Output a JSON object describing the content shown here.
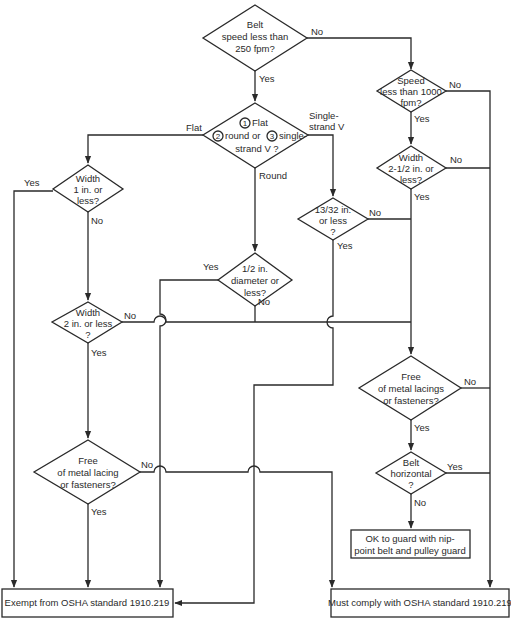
{
  "decisions": {
    "d1": {
      "lines": [
        "Belt",
        "speed less than",
        "250 fpm?"
      ]
    },
    "d2": {
      "lines": [
        "Flat",
        "round or",
        "single-",
        "strand V ?"
      ],
      "markers": [
        "1",
        "2",
        "3"
      ]
    },
    "d3": {
      "lines": [
        "Speed",
        "less than 1000",
        "fpm?"
      ]
    },
    "d4": {
      "lines": [
        "Width",
        "2-1/2 in. or",
        "less?"
      ]
    },
    "d5": {
      "lines": [
        "Width",
        "1 in. or",
        "less?"
      ]
    },
    "d6": {
      "lines": [
        "13/32 in.",
        "or less",
        "?"
      ]
    },
    "d7": {
      "lines": [
        "1/2 in.",
        "diameter or",
        "less?"
      ]
    },
    "d8": {
      "lines": [
        "Width",
        "2 in. or less",
        "?"
      ]
    },
    "d9": {
      "lines": [
        "Free",
        "of metal lacing",
        "or fasteners?"
      ]
    },
    "d10": {
      "lines": [
        "Free",
        "of metal lacings",
        "or fasteners?"
      ]
    },
    "d11": {
      "lines": [
        "Belt",
        "horizontal",
        "?"
      ]
    }
  },
  "branch_labels": {
    "d1_no": "No",
    "d1_yes": "Yes",
    "d2_flat": "Flat",
    "d2_round": "Round",
    "d2_single_1": "Single-",
    "d2_single_2": "strand V",
    "d3_no": "No",
    "d3_yes": "Yes",
    "d4_no": "No",
    "d4_yes": "Yes",
    "d5_yes": "Yes",
    "d5_no": "No",
    "d6_no": "No",
    "d6_yes": "Yes",
    "d7_yes": "Yes",
    "d7_no": "No",
    "d8_no": "No",
    "d8_yes": "Yes",
    "d9_no": "No",
    "d9_yes": "Yes",
    "d10_no": "No",
    "d10_yes": "Yes",
    "d11_yes": "Yes",
    "d11_no": "No"
  },
  "outcomes": {
    "guard": {
      "lines": [
        "OK to guard with nip-",
        "point belt and pulley guard"
      ]
    },
    "exempt": {
      "label": "Exempt from OSHA standard 1910.219"
    },
    "comply": {
      "label": "Must comply with OSHA standard 1910.219"
    }
  }
}
